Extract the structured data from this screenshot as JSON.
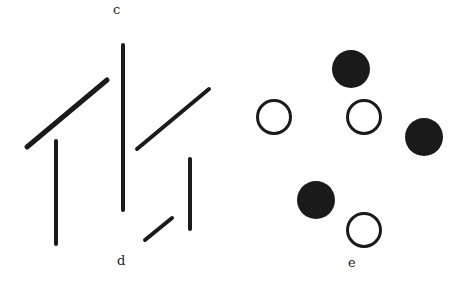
{
  "figure": {
    "labels": {
      "c": "c",
      "d": "d",
      "e": "e"
    },
    "colors": {
      "ink": "#1a1a1a",
      "background": "#ffffff"
    },
    "lines_panel": {
      "description": "Line segments: diagonals and verticals",
      "segments": [
        {
          "id": "long-diagonal-left",
          "x1": 27,
          "y1": 147,
          "x2": 107,
          "y2": 80,
          "stroke": 5
        },
        {
          "id": "vertical-left",
          "x1": 56,
          "y1": 141,
          "x2": 56,
          "y2": 244,
          "stroke": 4
        },
        {
          "id": "vertical-center-long",
          "x1": 123,
          "y1": 45,
          "x2": 123,
          "y2": 210,
          "stroke": 4
        },
        {
          "id": "diagonal-right",
          "x1": 137,
          "y1": 149,
          "x2": 209,
          "y2": 89,
          "stroke": 4
        },
        {
          "id": "vertical-right-short",
          "x1": 190,
          "y1": 159,
          "x2": 190,
          "y2": 229,
          "stroke": 4
        },
        {
          "id": "short-diagonal",
          "x1": 145,
          "y1": 240,
          "x2": 172,
          "y2": 218,
          "stroke": 4
        }
      ]
    },
    "circles_panel": {
      "description": "Filled and open circles",
      "circles": [
        {
          "id": "filled-top",
          "cx": 351,
          "cy": 69,
          "r": 19,
          "filled": true
        },
        {
          "id": "open-left",
          "cx": 274,
          "cy": 117,
          "r": 18,
          "filled": false
        },
        {
          "id": "open-center",
          "cx": 364,
          "cy": 117,
          "r": 18,
          "filled": false
        },
        {
          "id": "filled-right",
          "cx": 424,
          "cy": 137,
          "r": 19,
          "filled": true
        },
        {
          "id": "filled-bottom-left",
          "cx": 316,
          "cy": 200,
          "r": 19,
          "filled": true
        },
        {
          "id": "open-bottom",
          "cx": 364,
          "cy": 230,
          "r": 18,
          "filled": false
        }
      ]
    }
  }
}
